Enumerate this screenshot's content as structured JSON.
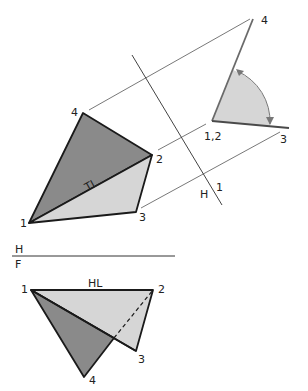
{
  "diagram": {
    "type": "descriptive-geometry-dihedral-angle",
    "colors": {
      "dark_face": "#8a8a8a",
      "light_face": "#d6d6d6",
      "edge": "#1a1a1a",
      "thin_line": "#555555",
      "aux_edge": "#6a6a6a",
      "arc": "#777777"
    },
    "top_view": {
      "labels": {
        "p1": "1",
        "p2": "2",
        "p3": "3",
        "p4": "4",
        "true_length": "TL"
      }
    },
    "front_view": {
      "labels": {
        "p1": "1",
        "p2": "2",
        "p3": "3",
        "p4": "4",
        "horizontal_line": "HL"
      }
    },
    "fold_lines": {
      "h_f": {
        "upper": "H",
        "lower": "F"
      },
      "h_1": {
        "left": "H",
        "right": "1"
      }
    },
    "auxiliary_view": {
      "labels": {
        "p12": "1,2",
        "p3": "3",
        "p4": "4"
      }
    }
  }
}
